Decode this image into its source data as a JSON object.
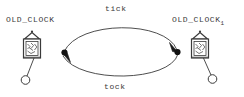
{
  "diagram": {
    "type": "state-transition-diagram",
    "background_color": "#ffffff",
    "ink_color": "#3a3a3a",
    "width": 244,
    "height": 97,
    "nodes": [
      {
        "id": "old-clock-left",
        "label": "OLD_CLOCK",
        "subscript": "",
        "icon": "cuckoo-clock-icon",
        "position": "left",
        "pendulum_direction": "down-left"
      },
      {
        "id": "old-clock-right",
        "label": "OLD_CLOCK",
        "subscript": "1",
        "icon": "cuckoo-clock-icon",
        "position": "right",
        "pendulum_direction": "down-right"
      }
    ],
    "edges": [
      {
        "id": "edge-tick",
        "label": "tick",
        "from": "old-clock-left",
        "to": "old-clock-right",
        "curve": "arc-up",
        "arrowhead": "end",
        "source_dot": true
      },
      {
        "id": "edge-tock",
        "label": "tock",
        "from": "old-clock-right",
        "to": "old-clock-left",
        "curve": "arc-down",
        "arrowhead": "end",
        "source_dot": true
      }
    ]
  }
}
